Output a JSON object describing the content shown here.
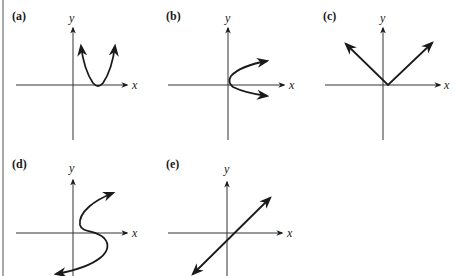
{
  "figure": {
    "colors": {
      "ink": "#1a1a1a",
      "axis": "#333333",
      "background": "#ffffff"
    },
    "panels": [
      {
        "id": "a",
        "label": "(a)",
        "x_axis_label": "x",
        "y_axis_label": "y",
        "shape": "upward parabola with vertex on positive x-axis"
      },
      {
        "id": "b",
        "label": "(b)",
        "x_axis_label": "x",
        "y_axis_label": "y",
        "shape": "sideways parabola opening right, vertex near origin"
      },
      {
        "id": "c",
        "label": "(c)",
        "x_axis_label": "x",
        "y_axis_label": "y",
        "shape": "V shape (absolute value) with vertex slightly right of origin"
      },
      {
        "id": "d",
        "label": "(d)",
        "x_axis_label": "x",
        "y_axis_label": "y",
        "shape": "S-shaped curve (not a function)"
      },
      {
        "id": "e",
        "label": "(e)",
        "x_axis_label": "x",
        "y_axis_label": "y",
        "shape": "straight line with positive slope"
      }
    ]
  }
}
